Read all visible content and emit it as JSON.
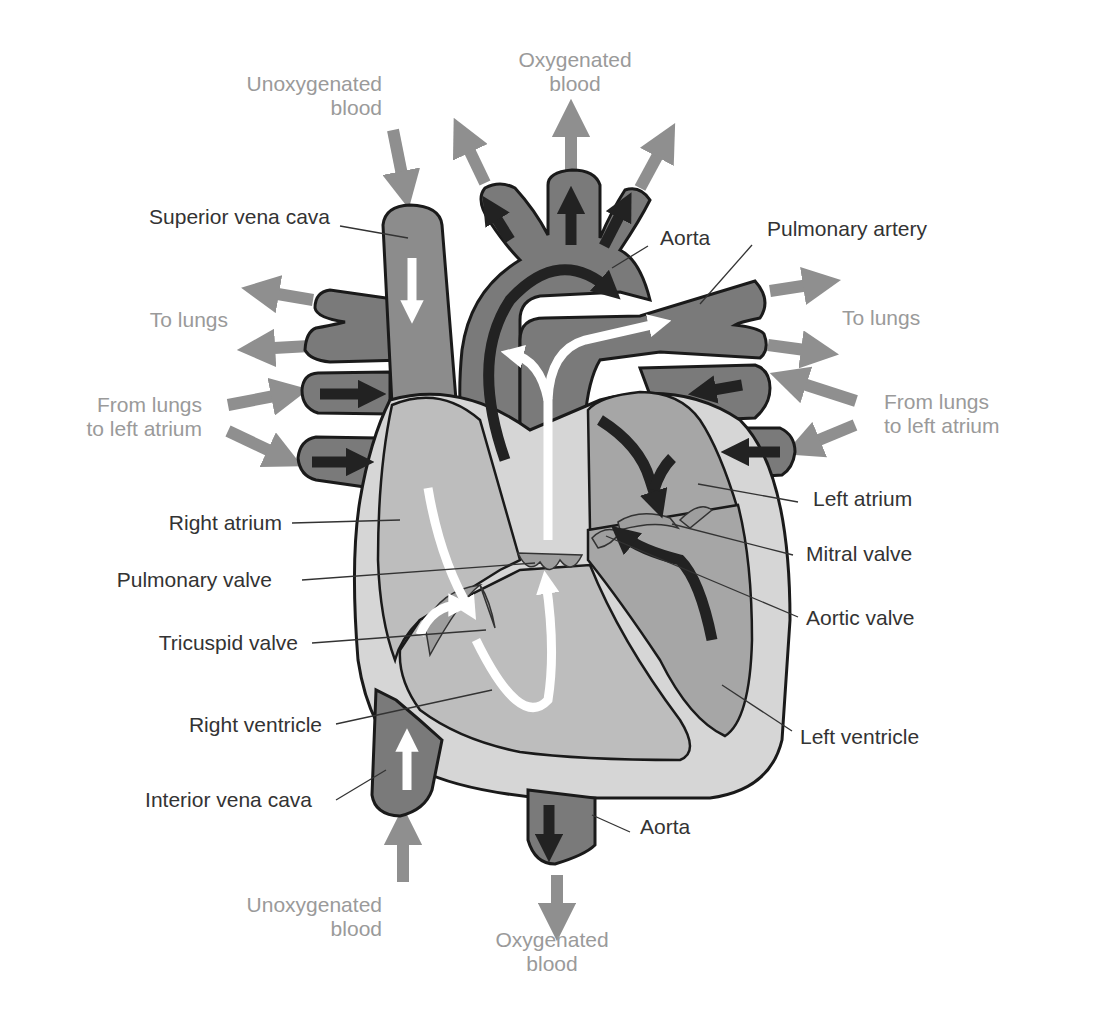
{
  "diagram": {
    "colors": {
      "vessel_dark": "#7a7a7a",
      "vessel_mid": "#8c8c8c",
      "chamber_light": "#bdbdbd",
      "wall_light": "#d6d6d6",
      "left_chamber": "#a6a6a6",
      "outline": "#1a1a1a",
      "flow_arrow_grey": "#8f8f8f",
      "inner_arrow_dark": "#222222",
      "inner_arrow_white": "#ffffff",
      "label_text": "#333333",
      "flow_text": "#9a9a9a"
    },
    "flow_labels": {
      "top_oxygenated": [
        "Oxygenated",
        "blood"
      ],
      "top_unoxygenated": [
        "Unoxygenated",
        "blood"
      ],
      "left_to_lungs": "To lungs",
      "right_to_lungs": "To lungs",
      "left_from_lungs": [
        "From lungs",
        "to left atrium"
      ],
      "right_from_lungs": [
        "From lungs",
        "to left atrium"
      ],
      "bottom_unoxygenated": [
        "Unoxygenated",
        "blood"
      ],
      "bottom_oxygenated": [
        "Oxygenated",
        "blood"
      ]
    },
    "structure_labels": {
      "superior_vena_cava": "Superior vena cava",
      "aorta_top": "Aorta",
      "pulmonary_artery": "Pulmonary artery",
      "right_atrium": "Right atrium",
      "pulmonary_valve": "Pulmonary valve",
      "tricuspid_valve": "Tricuspid valve",
      "right_ventricle": "Right ventricle",
      "interior_vena_cava": "Interior vena cava",
      "left_atrium": "Left atrium",
      "mitral_valve": "Mitral valve",
      "aortic_valve": "Aortic valve",
      "left_ventricle": "Left ventricle",
      "aorta_bottom": "Aorta"
    }
  }
}
